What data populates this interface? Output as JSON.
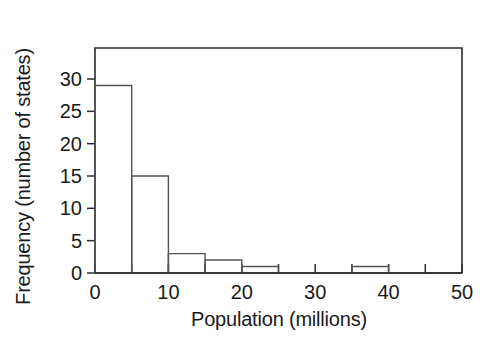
{
  "chart_data": {
    "type": "bar",
    "title": "",
    "subtitle": "",
    "xlabel": "Population (millions)",
    "ylabel": "Frequency (number of states)",
    "xlim": [
      0,
      50
    ],
    "ylim": [
      0,
      34
    ],
    "bin_width": 5,
    "grid": false,
    "legend": null,
    "x_tick_values": [
      0,
      5,
      10,
      15,
      20,
      25,
      30,
      35,
      40,
      45,
      50
    ],
    "x_tick_labels": [
      "0",
      "",
      "10",
      "",
      "20",
      "",
      "30",
      "",
      "40",
      "",
      "50"
    ],
    "y_tick_values": [
      0,
      5,
      10,
      15,
      20,
      25,
      30
    ],
    "y_tick_labels": [
      "0",
      "5",
      "10",
      "15",
      "20",
      "25",
      "30"
    ],
    "bin_edges": [
      0,
      5,
      10,
      15,
      20,
      25,
      30,
      35,
      40,
      45,
      50
    ],
    "categories": [
      "0-5",
      "5-10",
      "10-15",
      "15-20",
      "20-25",
      "25-30",
      "30-35",
      "35-40",
      "40-45",
      "45-50"
    ],
    "values": [
      29,
      15,
      3,
      2,
      1,
      0,
      0,
      1,
      0,
      0
    ],
    "colors": {
      "bar_stroke": "#555555",
      "bar_fill": "none",
      "axis": "#2b2b2b",
      "text": "#1a1a1a",
      "background": "#ffffff"
    }
  }
}
